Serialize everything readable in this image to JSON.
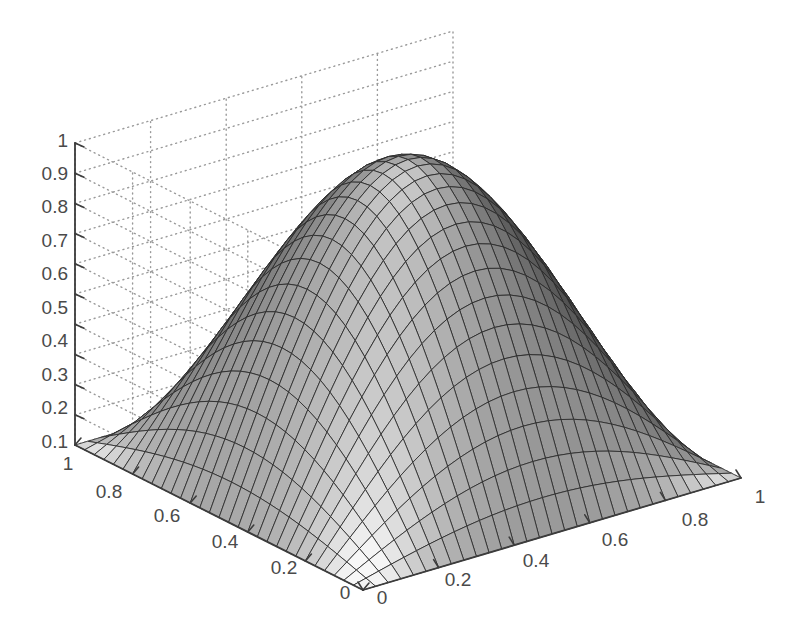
{
  "figure": {
    "background_color": "#ffffff",
    "axis_color": "#3c3c3c",
    "grid_color": "#9a9a9a",
    "tick_label_color": "#4a4a4a",
    "mesh_line_color": "#2b2b2b",
    "surface_light_color": "#f2f2f2",
    "surface_dark_color": "#3a3a3a"
  },
  "chart_data": {
    "type": "surface",
    "title": "",
    "xlabel": "",
    "ylabel": "",
    "zlabel": "",
    "grid": true,
    "legend": false,
    "function": "z = sin(pi*x) * sin(pi*y)",
    "xlim": [
      0,
      1
    ],
    "ylim": [
      0,
      1
    ],
    "zlim": [
      0,
      1
    ],
    "mesh_n": 30,
    "view_azimuth_deg": -37.5,
    "view_elevation_deg": 30,
    "z_axis": {
      "label": "",
      "ticks": [
        0.1,
        0.2,
        0.3,
        0.4,
        0.5,
        0.6,
        0.7,
        0.8,
        0.9,
        1
      ],
      "tick_labels": [
        "0.1",
        "0.2",
        "0.3",
        "0.4",
        "0.5",
        "0.6",
        "0.7",
        "0.8",
        "0.9",
        "1"
      ],
      "range": [
        0,
        1
      ]
    },
    "y_axis_left": {
      "label": "",
      "ticks": [
        1,
        0.8,
        0.6,
        0.4,
        0.2,
        0
      ],
      "tick_labels": [
        "1",
        "0.8",
        "0.6",
        "0.4",
        "0.2",
        "0"
      ],
      "range": [
        0,
        1
      ]
    },
    "x_axis_right": {
      "label": "",
      "ticks": [
        0,
        0.2,
        0.4,
        0.6,
        0.8,
        1
      ],
      "tick_labels": [
        "0",
        "0.2",
        "0.4",
        "0.6",
        "0.8",
        "1"
      ],
      "range": [
        0,
        1
      ]
    },
    "z_tick_labels_positions": [
      {
        "text": "1",
        "x": 68,
        "y": 140
      },
      {
        "text": "0.9",
        "x": 68,
        "y": 173
      },
      {
        "text": "0.8",
        "x": 68,
        "y": 206
      },
      {
        "text": "0.7",
        "x": 68,
        "y": 240
      },
      {
        "text": "0.6",
        "x": 68,
        "y": 273
      },
      {
        "text": "0.5",
        "x": 68,
        "y": 307
      },
      {
        "text": "0.4",
        "x": 68,
        "y": 340
      },
      {
        "text": "0.3",
        "x": 68,
        "y": 374
      },
      {
        "text": "0.2",
        "x": 68,
        "y": 407
      },
      {
        "text": "0.1",
        "x": 68,
        "y": 441
      }
    ],
    "y_tick_labels_positions": [
      {
        "text": "1",
        "x": 68,
        "y": 463
      },
      {
        "text": "0.8",
        "x": 109,
        "y": 491
      },
      {
        "text": "0.6",
        "x": 167,
        "y": 515
      },
      {
        "text": "0.4",
        "x": 225,
        "y": 541
      },
      {
        "text": "0.2",
        "x": 284,
        "y": 567
      },
      {
        "text": "0",
        "x": 345,
        "y": 592
      }
    ],
    "x_tick_labels_positions": [
      {
        "text": "0",
        "x": 382,
        "y": 597
      },
      {
        "text": "0.2",
        "x": 458,
        "y": 579
      },
      {
        "text": "0.4",
        "x": 536,
        "y": 560
      },
      {
        "text": "0.6",
        "x": 615,
        "y": 539
      },
      {
        "text": "0.8",
        "x": 695,
        "y": 519
      },
      {
        "text": "1",
        "x": 760,
        "y": 496
      }
    ],
    "geometry": {
      "corner_origin": {
        "x": 363,
        "y": 590
      },
      "corner_left_floor": {
        "x": 75,
        "y": 445
      },
      "corner_right_floor": {
        "x": 741,
        "y": 478
      },
      "corner_back_floor": {
        "x": 452,
        "y": 356
      },
      "corner_left_top": {
        "x": 75,
        "y": 143
      },
      "corner_right_top": {
        "x": 741,
        "y": 176
      },
      "corner_back_top": {
        "x": 452,
        "y": 40
      }
    }
  }
}
